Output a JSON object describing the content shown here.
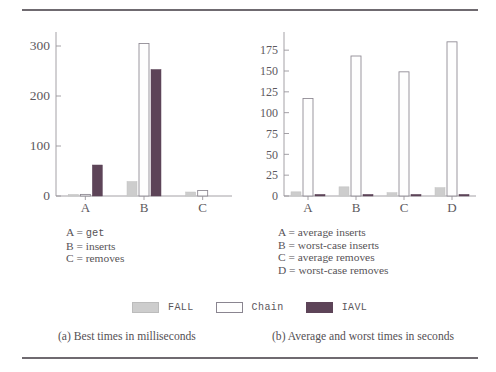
{
  "figure": {
    "legend": {
      "position": "bottom-center",
      "entries": [
        {
          "label": "FALL",
          "color": "#cdcdcd"
        },
        {
          "label": "Chain",
          "color": "#fefefe"
        },
        {
          "label": "IAVL",
          "color": "#5d4458"
        }
      ]
    },
    "captions": {
      "a": "(a) Best times in milliseconds",
      "b": "(b) Average and worst times in seconds"
    },
    "keys": {
      "a": [
        {
          "letter": "A",
          "eq": "=",
          "value": "get",
          "mono": true
        },
        {
          "letter": "B",
          "eq": "=",
          "value": "inserts",
          "mono": false
        },
        {
          "letter": "C",
          "eq": "=",
          "value": "removes",
          "mono": false
        }
      ],
      "b": [
        {
          "letter": "A",
          "eq": "=",
          "value": "average inserts",
          "mono": false
        },
        {
          "letter": "B",
          "eq": "=",
          "value": "worst-case inserts",
          "mono": false
        },
        {
          "letter": "C",
          "eq": "=",
          "value": "average removes",
          "mono": false
        },
        {
          "letter": "D",
          "eq": "=",
          "value": "worst-case removes",
          "mono": false
        }
      ]
    }
  },
  "chart_data": [
    {
      "id": "panel-a",
      "type": "bar",
      "title": "(a) Best times in milliseconds",
      "xlabel": "",
      "ylabel": "",
      "ylim": [
        0,
        320
      ],
      "yticks": [
        0,
        100,
        200,
        300
      ],
      "ytick_labels": [
        "0",
        "100",
        "200",
        "300"
      ],
      "grid": false,
      "categories": [
        "A",
        "B",
        "C"
      ],
      "category_meanings": [
        "get",
        "inserts",
        "removes"
      ],
      "series": [
        {
          "name": "FALL",
          "color": "#cdcdcd",
          "values": [
            2,
            29,
            8
          ]
        },
        {
          "name": "Chain",
          "color": "#fefefe",
          "values": [
            1,
            305,
            11
          ]
        },
        {
          "name": "IAVL",
          "color": "#5d4458",
          "values": [
            62,
            253,
            0
          ]
        }
      ],
      "units": "milliseconds"
    },
    {
      "id": "panel-b",
      "type": "bar",
      "title": "(b) Average and worst times in seconds",
      "xlabel": "",
      "ylabel": "",
      "ylim": [
        0,
        192
      ],
      "yticks": [
        0,
        25,
        50,
        75,
        100,
        125,
        150,
        175
      ],
      "ytick_labels": [
        "0",
        "25",
        "50",
        "75",
        "100",
        "125",
        "150",
        "175"
      ],
      "grid": false,
      "categories": [
        "A",
        "B",
        "C",
        "D"
      ],
      "category_meanings": [
        "average inserts",
        "worst-case inserts",
        "average removes",
        "worst-case removes"
      ],
      "series": [
        {
          "name": "FALL",
          "color": "#cdcdcd",
          "values": [
            5,
            11,
            4,
            10
          ]
        },
        {
          "name": "Chain",
          "color": "#fefefe",
          "values": [
            117,
            168,
            149,
            185
          ]
        },
        {
          "name": "IAVL",
          "color": "#5d4458",
          "values": [
            1,
            1,
            1,
            1
          ]
        }
      ],
      "units": "seconds"
    }
  ]
}
